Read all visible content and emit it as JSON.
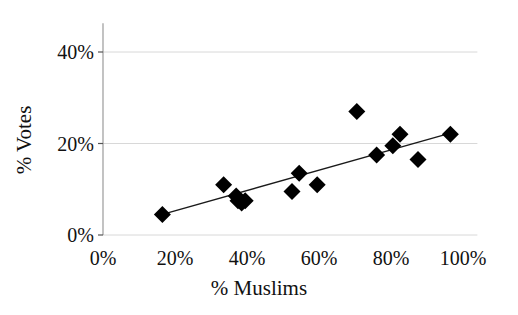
{
  "chart_data": {
    "type": "scatter",
    "title": "",
    "xlabel": "% Muslims",
    "ylabel": "% Votes",
    "xlim": [
      0,
      100
    ],
    "ylim": [
      0,
      45
    ],
    "xticks": [
      "0%",
      "20%",
      "40%",
      "60%",
      "80%",
      "100%"
    ],
    "xtick_values": [
      0,
      20,
      40,
      60,
      80,
      100
    ],
    "yticks": [
      "0%",
      "20%",
      "40%"
    ],
    "ytick_values": [
      0,
      20,
      40
    ],
    "grid": "horizontal-only",
    "legend": "none",
    "marker": "filled-diamond",
    "marker_color": "#000000",
    "points": [
      {
        "x": 16.5,
        "y": 4.5
      },
      {
        "x": 33.5,
        "y": 11.0
      },
      {
        "x": 37.0,
        "y": 8.5
      },
      {
        "x": 37.5,
        "y": 7.5
      },
      {
        "x": 38.5,
        "y": 7.0
      },
      {
        "x": 39.5,
        "y": 7.5
      },
      {
        "x": 52.5,
        "y": 9.5
      },
      {
        "x": 54.5,
        "y": 13.5
      },
      {
        "x": 59.5,
        "y": 11.0
      },
      {
        "x": 70.5,
        "y": 27.0
      },
      {
        "x": 76.0,
        "y": 17.5
      },
      {
        "x": 80.5,
        "y": 19.5
      },
      {
        "x": 82.5,
        "y": 22.0
      },
      {
        "x": 87.5,
        "y": 16.5
      },
      {
        "x": 96.5,
        "y": 22.0
      }
    ],
    "trendline": {
      "type": "linear",
      "x_start": 16.5,
      "y_start": 4.5,
      "x_end": 97.5,
      "y_end": 22.5
    }
  },
  "axes": {
    "y_title": "% Votes",
    "x_title": "% Muslims",
    "y_tick_labels": [
      "40%",
      "20%",
      "0%"
    ],
    "x_tick_labels": [
      "0%",
      "20%",
      "40%",
      "60%",
      "80%",
      "100%"
    ]
  },
  "colors": {
    "marker": "#000000",
    "trendline": "#1a1a1a",
    "gridline": "#d8d8d8",
    "axis": "#9a9a9a",
    "text": "#111111",
    "background": "#ffffff"
  }
}
